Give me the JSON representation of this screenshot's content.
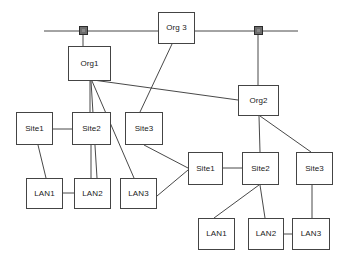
{
  "diagram": {
    "type": "network-topology",
    "canvas": {
      "width": 345,
      "height": 264
    },
    "colors": {
      "background": "#ffffff",
      "box_border": "#444444",
      "box_fill": "#ffffff",
      "link": "#333333",
      "connector_fill": "#6e6e6e",
      "connector_border": "#2b2b2b",
      "text": "#1a1a1a"
    },
    "backbone": {
      "name": "horizontal-bus",
      "y": 31,
      "x_start": 44,
      "x_end": 298
    },
    "connectors": [
      {
        "id": "bus-connector-left",
        "label": "",
        "x": 79,
        "y": 26,
        "size": 9
      },
      {
        "id": "bus-connector-right",
        "label": "",
        "x": 254,
        "y": 26,
        "size": 9
      }
    ],
    "nodes": [
      {
        "id": "org3",
        "label": "Org 3",
        "x": 158,
        "y": 12,
        "w": 37,
        "h": 32,
        "group": "backbone"
      },
      {
        "id": "org1",
        "label": "Org1",
        "x": 68,
        "y": 46,
        "w": 43,
        "h": 35,
        "group": "left"
      },
      {
        "id": "org2",
        "label": "Org2",
        "x": 238,
        "y": 85,
        "w": 41,
        "h": 31,
        "group": "right"
      },
      {
        "id": "l-site1",
        "label": "Site1",
        "x": 16,
        "y": 112,
        "w": 37,
        "h": 33,
        "group": "left"
      },
      {
        "id": "l-site2",
        "label": "Site2",
        "x": 72,
        "y": 112,
        "w": 39,
        "h": 33,
        "group": "left"
      },
      {
        "id": "l-site3",
        "label": "Site3",
        "x": 125,
        "y": 112,
        "w": 38,
        "h": 33,
        "group": "left"
      },
      {
        "id": "l-lan1",
        "label": "LAN1",
        "x": 26,
        "y": 178,
        "w": 37,
        "h": 31,
        "group": "left"
      },
      {
        "id": "l-lan2",
        "label": "LAN2",
        "x": 74,
        "y": 178,
        "w": 37,
        "h": 31,
        "group": "left"
      },
      {
        "id": "l-lan3",
        "label": "LAN3",
        "x": 120,
        "y": 178,
        "w": 37,
        "h": 31,
        "group": "left"
      },
      {
        "id": "r-site1",
        "label": "Site1",
        "x": 188,
        "y": 152,
        "w": 35,
        "h": 33,
        "group": "right"
      },
      {
        "id": "r-site2",
        "label": "Site2",
        "x": 242,
        "y": 152,
        "w": 37,
        "h": 33,
        "group": "right"
      },
      {
        "id": "r-site3",
        "label": "Site3",
        "x": 296,
        "y": 152,
        "w": 37,
        "h": 33,
        "group": "right"
      },
      {
        "id": "r-lan1",
        "label": "LAN1",
        "x": 198,
        "y": 218,
        "w": 37,
        "h": 32,
        "group": "right"
      },
      {
        "id": "r-lan2",
        "label": "LAN2",
        "x": 248,
        "y": 218,
        "w": 36,
        "h": 32,
        "group": "right"
      },
      {
        "id": "r-lan3",
        "label": "LAN3",
        "x": 292,
        "y": 218,
        "w": 38,
        "h": 32,
        "group": "right"
      }
    ],
    "links": [
      {
        "id": "link-bus-left-end",
        "x1": 44,
        "y1": 31,
        "x2": 79,
        "y2": 31
      },
      {
        "id": "link-bus-mid",
        "x1": 88,
        "y1": 31,
        "x2": 158,
        "y2": 31
      },
      {
        "id": "link-bus-org3-right",
        "x1": 195,
        "y1": 31,
        "x2": 254,
        "y2": 31
      },
      {
        "id": "link-bus-right-end",
        "x1": 263,
        "y1": 31,
        "x2": 298,
        "y2": 31
      },
      {
        "id": "link-connL-org1",
        "x1": 83,
        "y1": 35,
        "x2": 83,
        "y2": 46
      },
      {
        "id": "link-connR-org2",
        "x1": 258,
        "y1": 35,
        "x2": 258,
        "y2": 85
      },
      {
        "id": "link-org3-site3",
        "x1": 172,
        "y1": 44,
        "x2": 140,
        "y2": 112
      },
      {
        "id": "link-org1-site2",
        "x1": 90,
        "y1": 81,
        "x2": 90,
        "y2": 112
      },
      {
        "id": "link-org1-lan2",
        "x1": 91,
        "y1": 81,
        "x2": 97,
        "y2": 178
      },
      {
        "id": "link-org1-lan3",
        "x1": 92,
        "y1": 81,
        "x2": 134,
        "y2": 178
      },
      {
        "id": "link-org1-org2",
        "x1": 93,
        "y1": 80,
        "x2": 238,
        "y2": 100
      },
      {
        "id": "link-lsite1-lsite2",
        "x1": 53,
        "y1": 129,
        "x2": 72,
        "y2": 129
      },
      {
        "id": "link-lsite1-llan1",
        "x1": 38,
        "y1": 145,
        "x2": 46,
        "y2": 178
      },
      {
        "id": "link-lsite2-llan2",
        "x1": 91,
        "y1": 145,
        "x2": 91,
        "y2": 178
      },
      {
        "id": "link-llan1-llan2",
        "x1": 63,
        "y1": 193,
        "x2": 74,
        "y2": 193
      },
      {
        "id": "link-lsite3-rsite1",
        "x1": 144,
        "y1": 145,
        "x2": 188,
        "y2": 168
      },
      {
        "id": "link-llan3-rsite1",
        "x1": 157,
        "y1": 196,
        "x2": 188,
        "y2": 170
      },
      {
        "id": "link-org2-rsite2",
        "x1": 259,
        "y1": 116,
        "x2": 260,
        "y2": 152
      },
      {
        "id": "link-org2-rsite3",
        "x1": 260,
        "y1": 116,
        "x2": 311,
        "y2": 152
      },
      {
        "id": "link-rsite1-rsite2",
        "x1": 223,
        "y1": 168,
        "x2": 242,
        "y2": 168
      },
      {
        "id": "link-rsite2-rlan1",
        "x1": 259,
        "y1": 185,
        "x2": 214,
        "y2": 218
      },
      {
        "id": "link-rsite2-rlan2",
        "x1": 260,
        "y1": 185,
        "x2": 265,
        "y2": 218
      },
      {
        "id": "link-rsite3-rlan3",
        "x1": 312,
        "y1": 185,
        "x2": 312,
        "y2": 218
      },
      {
        "id": "link-rlan2-rlan3",
        "x1": 284,
        "y1": 234,
        "x2": 292,
        "y2": 234
      }
    ]
  }
}
